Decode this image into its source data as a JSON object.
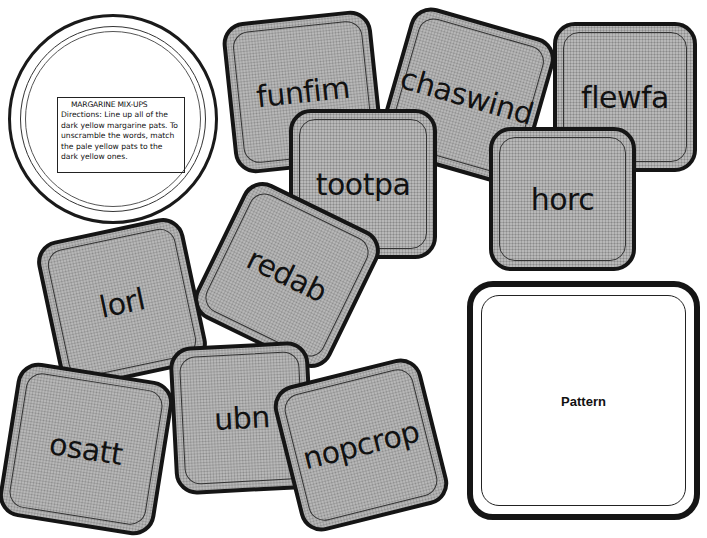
{
  "lid": {
    "title": "MARGARINE MIX-UPS",
    "directions_label": "Directions:",
    "directions_text": "Line up all of the dark yellow margarine pats. To unscramble the words, match the pale yellow pats to the dark yellow ones."
  },
  "tiles": [
    {
      "word": "funfim",
      "left": 228,
      "top": 16,
      "w": 150,
      "h": 152,
      "rotate": -6
    },
    {
      "word": "chaswind",
      "left": 392,
      "top": 20,
      "w": 150,
      "h": 152,
      "rotate": 16
    },
    {
      "word": "flewfa",
      "left": 553,
      "top": 22,
      "w": 144,
      "h": 150,
      "rotate": 0
    },
    {
      "word": "horc",
      "left": 489,
      "top": 127,
      "w": 147,
      "h": 144,
      "rotate": 0
    },
    {
      "word": "tootpa",
      "left": 289,
      "top": 109,
      "w": 148,
      "h": 150,
      "rotate": 0
    },
    {
      "word": "redab",
      "left": 212,
      "top": 200,
      "w": 150,
      "h": 150,
      "rotate": 26
    },
    {
      "word": "lorl",
      "left": 47,
      "top": 228,
      "w": 150,
      "h": 150,
      "rotate": -12
    },
    {
      "word": "ubn",
      "left": 172,
      "top": 344,
      "w": 140,
      "h": 148,
      "rotate": -3
    },
    {
      "word": "osatt",
      "left": 7,
      "top": 371,
      "w": 158,
      "h": 156,
      "rotate": 9
    },
    {
      "word": "nopcrop",
      "left": 285,
      "top": 370,
      "w": 152,
      "h": 150,
      "rotate": -14
    }
  ],
  "pattern": {
    "label": "Pattern"
  },
  "colors": {
    "tile_fill": "#b8b8b8",
    "outline": "#151515",
    "background": "#ffffff"
  }
}
